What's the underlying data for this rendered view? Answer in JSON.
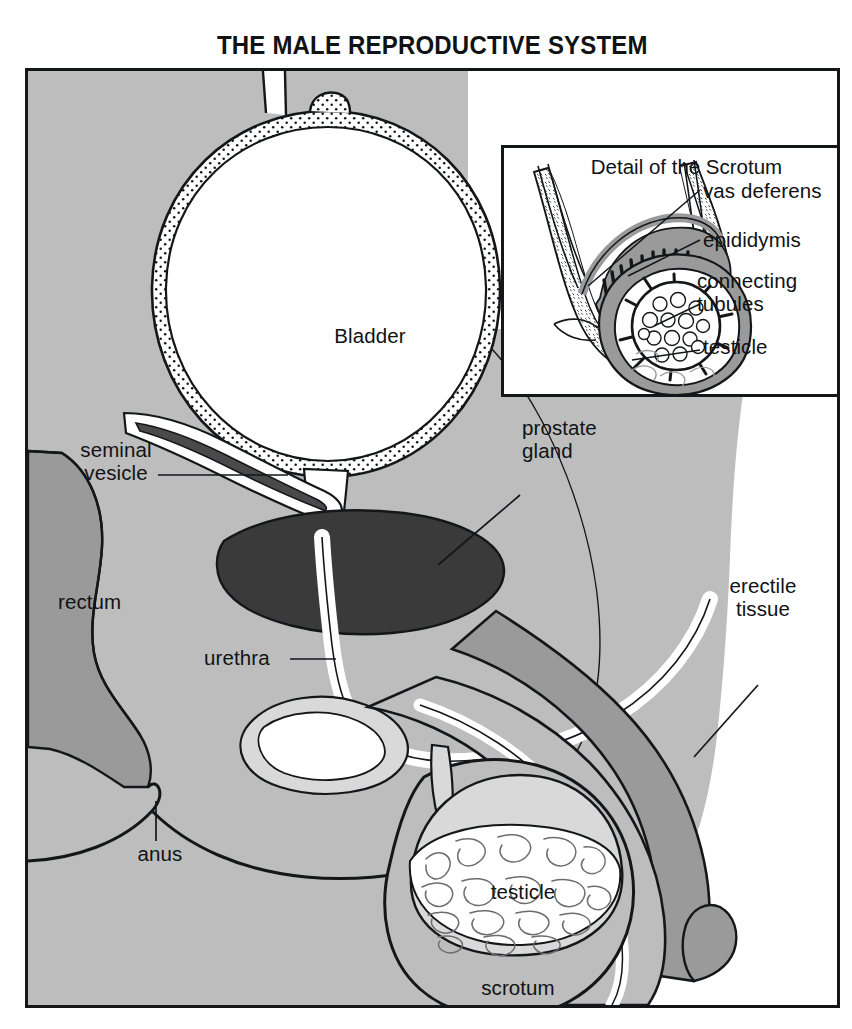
{
  "figure": {
    "title": "THE MALE REPRODUCTIVE SYSTEM",
    "kind": "anatomical-diagram",
    "view": "mid-sagittal section"
  },
  "colors": {
    "ink": "#14161a",
    "page": "#ffffff",
    "body_tissue": "#bdbdbd",
    "mid_gray": "#9a9a9a",
    "dark_gray": "#6d6d6d",
    "prostate": "#3a3a3a",
    "seminal_vesicle": "#4a4a4a",
    "pale": "#d9d9d9",
    "white": "#ffffff"
  },
  "main_labels": [
    {
      "id": "bladder",
      "text": "Bladder",
      "x": 342,
      "y": 265,
      "align": "center",
      "leader": false
    },
    {
      "id": "seminal-vesicle",
      "text": "seminal\nvesicle",
      "x": 88,
      "y": 437,
      "align": "center",
      "leader": true
    },
    {
      "id": "prostate-gland",
      "text": "prostate\ngland",
      "x": 497,
      "y": 419,
      "align": "left",
      "leader": true
    },
    {
      "id": "rectum",
      "text": "rectum",
      "x": 55,
      "y": 594,
      "align": "left",
      "leader": false
    },
    {
      "id": "urethra",
      "text": "urethra",
      "x": 200,
      "y": 634,
      "align": "left",
      "leader": true
    },
    {
      "id": "erectile-tissue",
      "text": "erectile\ntissue",
      "x": 736,
      "y": 568,
      "align": "center",
      "leader": true
    },
    {
      "id": "anus",
      "text": "anus",
      "x": 133,
      "y": 815,
      "align": "center",
      "leader": true
    },
    {
      "id": "testicle",
      "text": "testicle",
      "x": 536,
      "y": 830,
      "align": "center",
      "leader": false
    },
    {
      "id": "scrotum",
      "text": "scrotum",
      "x": 531,
      "y": 930,
      "align": "center",
      "leader": false
    }
  ],
  "inset": {
    "title": "Detail of the Scrotum",
    "labels": [
      {
        "id": "vas-deferens",
        "text": "vas deferens",
        "x": 206,
        "y": 44,
        "leader": true
      },
      {
        "id": "epididymis",
        "text": "epididymis",
        "x": 206,
        "y": 93,
        "leader": true
      },
      {
        "id": "connecting-tubules",
        "text": "connecting\ntubules",
        "x": 200,
        "y": 134,
        "leader": true
      },
      {
        "id": "testicle",
        "text": "testicle",
        "x": 206,
        "y": 198,
        "leader": true
      }
    ]
  }
}
